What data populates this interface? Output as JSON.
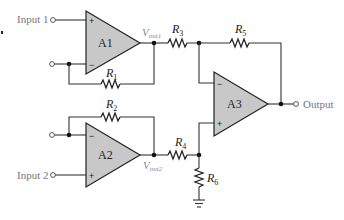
{
  "diagram": {
    "type": "instrumentation-amplifier",
    "inputs": [
      {
        "label": "Input 1"
      },
      {
        "label": "Input 2"
      }
    ],
    "output": {
      "label": "Output"
    },
    "amplifiers": [
      {
        "id": "A1",
        "label": "A1",
        "plus": "+",
        "minus": "−"
      },
      {
        "id": "A2",
        "label": "A2",
        "plus": "+",
        "minus": "−"
      },
      {
        "id": "A3",
        "label": "A3",
        "plus": "+",
        "minus": "−"
      }
    ],
    "resistors": [
      {
        "id": "R1",
        "base": "R",
        "sub": "1"
      },
      {
        "id": "R2",
        "base": "R",
        "sub": "2"
      },
      {
        "id": "R3",
        "base": "R",
        "sub": "3"
      },
      {
        "id": "R4",
        "base": "R",
        "sub": "4"
      },
      {
        "id": "R5",
        "base": "R",
        "sub": "5"
      },
      {
        "id": "R6",
        "base": "R",
        "sub": "6"
      }
    ],
    "voltages": [
      {
        "base": "V",
        "sub": "out1"
      },
      {
        "base": "V",
        "sub": "out2"
      }
    ],
    "colors": {
      "amp_fill": "#c8c8c8",
      "wire": "#333333",
      "label": "#777777"
    }
  }
}
